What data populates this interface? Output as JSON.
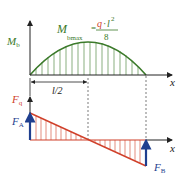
{
  "colors": {
    "moment": "#3b7a2a",
    "shear": "#d0402a",
    "reaction": "#1f3f8f",
    "axis": "#222222",
    "formula_q": "#d0402a"
  },
  "moment_diagram": {
    "axis_label_main": "M",
    "axis_label_sub": "b",
    "x_label": "x",
    "max_label_main": "M",
    "max_label_sub": "bmax",
    "equals": "=",
    "formula_q": "q",
    "formula_dot": "·",
    "formula_l": "l",
    "formula_exp": "2",
    "formula_den": "8"
  },
  "dimension": {
    "label": "l/2"
  },
  "shear_diagram": {
    "axis_label_main": "F",
    "axis_label_sub": "q",
    "x_label": "x",
    "reaction_a_main": "F",
    "reaction_a_sub": "A",
    "reaction_b_main": "F",
    "reaction_b_sub": "B"
  }
}
